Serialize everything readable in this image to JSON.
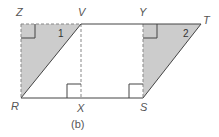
{
  "figure": {
    "caption": "(b)",
    "colors": {
      "line": "#444444",
      "shade": "#cccccc",
      "dashed": "#888888",
      "label": "#555555"
    },
    "points": {
      "Z": "Z",
      "V": "V",
      "Y": "Y",
      "T": "T",
      "R": "R",
      "X": "X",
      "S": "S"
    },
    "regions": {
      "region1": "1",
      "region2": "2"
    }
  }
}
